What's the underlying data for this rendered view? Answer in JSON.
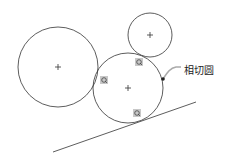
{
  "diagram": {
    "label": "相切圆",
    "colors": {
      "stroke": "#333333",
      "marker_bg": "#c8c8c8",
      "background": "#ffffff"
    },
    "circles": [
      {
        "id": "large",
        "cx": 58,
        "cy": 67,
        "r": 40
      },
      {
        "id": "small",
        "cx": 150,
        "cy": 35,
        "r": 22
      },
      {
        "id": "tangent",
        "cx": 128,
        "cy": 88,
        "r": 35
      }
    ],
    "line": {
      "x1": 53,
      "y1": 152,
      "x2": 196,
      "y2": 102
    },
    "tangent_markers": [
      {
        "x": 104,
        "y": 80
      },
      {
        "x": 139,
        "y": 62
      },
      {
        "x": 137,
        "y": 113
      }
    ],
    "pointer": {
      "x": 163,
      "y": 79
    }
  }
}
